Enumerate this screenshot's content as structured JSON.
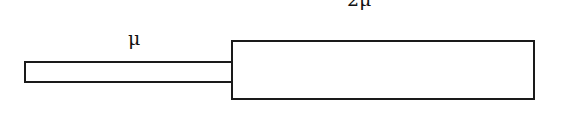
{
  "diagram": {
    "segments": [
      {
        "id": "thin",
        "label": "μ",
        "description": "thin string segment"
      },
      {
        "id": "thick",
        "label": "2μ",
        "description": "thick string segment"
      }
    ],
    "colors": {
      "stroke": "#1a1a1a",
      "background": "#ffffff",
      "text": "#111111"
    }
  }
}
